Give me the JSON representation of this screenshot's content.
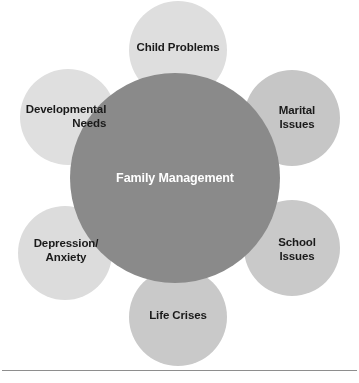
{
  "diagram": {
    "type": "venn-cluster",
    "title": "Family Management",
    "center": {
      "label": "Family Management",
      "color": "#8a8a8a",
      "text_color": "#ffffff",
      "cx": 175,
      "cy": 178,
      "r": 105
    },
    "nodes": [
      {
        "id": "child-problems",
        "label": "Child Problems",
        "color": "#dedede",
        "cx": 178,
        "cy": 50,
        "r": 49,
        "label_x": 178,
        "label_y": 48,
        "align": "center"
      },
      {
        "id": "marital-issues",
        "label": "Marital Issues",
        "color": "#c6c6c6",
        "cx": 292,
        "cy": 118,
        "r": 48,
        "label_x": 297,
        "label_y": 117,
        "align": "center"
      },
      {
        "id": "school-issues",
        "label": "School Issues",
        "color": "#c9c9c9",
        "cx": 292,
        "cy": 248,
        "r": 48,
        "label_x": 297,
        "label_y": 249,
        "align": "center"
      },
      {
        "id": "life-crises",
        "label": "Life Crises",
        "color": "#c9c9c9",
        "cx": 178,
        "cy": 317,
        "r": 49,
        "label_x": 178,
        "label_y": 316,
        "align": "center"
      },
      {
        "id": "depression-anxiety",
        "label": "Depression/\nAnxiety",
        "color": "#dcdcdc",
        "cx": 65,
        "cy": 253,
        "r": 47,
        "label_x": 66,
        "label_y": 250,
        "align": "center"
      },
      {
        "id": "developmental-needs",
        "label": "Developmental\nNeeds",
        "color": "#dfdfdf",
        "cx": 68,
        "cy": 117,
        "r": 48,
        "label_x": 66,
        "label_y": 116,
        "align": "right"
      }
    ],
    "rule": {
      "y": 370,
      "color": "#8e8e8e"
    },
    "background": "#ffffff"
  }
}
